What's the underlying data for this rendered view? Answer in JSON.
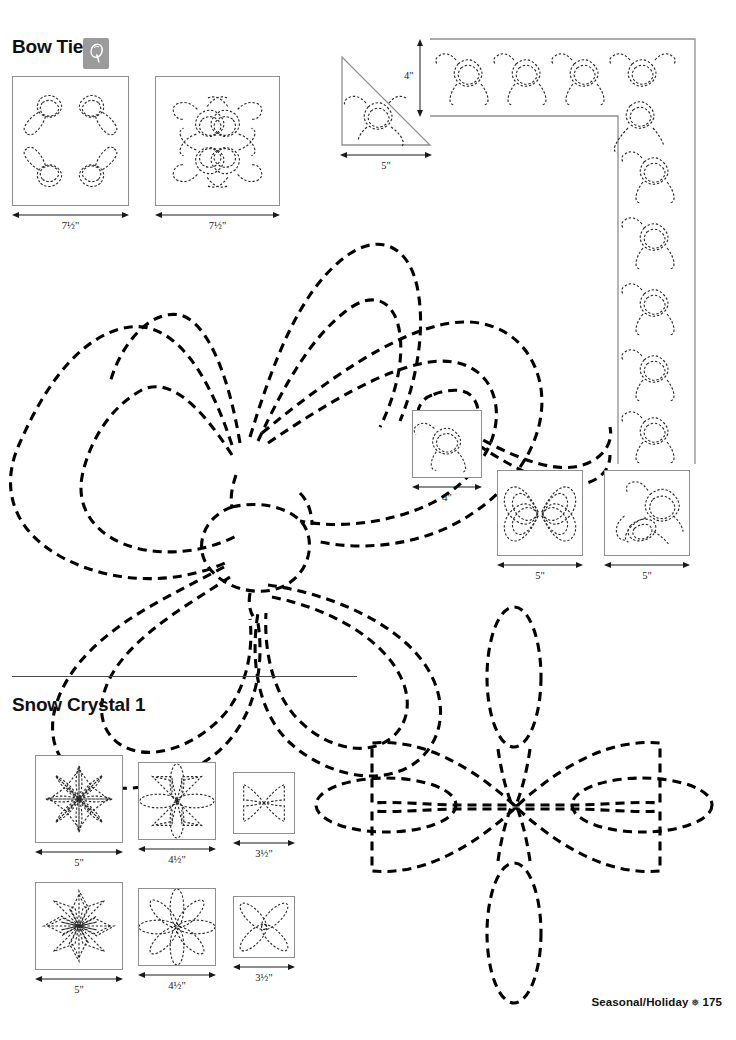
{
  "page": {
    "background": "#ffffff",
    "width": 736,
    "height": 1040
  },
  "sections": [
    {
      "id": "bow-tie",
      "title": "Bow Tie",
      "has_logo_badge": true,
      "logo_glyph": "Q"
    },
    {
      "id": "snow-crystal-1",
      "title": "Snow Crystal 1",
      "has_logo_badge": false,
      "logo_glyph": ""
    }
  ],
  "bow_tie": {
    "title": "Bow Tie",
    "badge_icon": "quilting-q-icon",
    "blocks": [
      {
        "name": "bow-wreath-square",
        "size_label": "7½\"",
        "shape": "square"
      },
      {
        "name": "bow-cluster-square",
        "size_label": "7½\"",
        "shape": "square"
      },
      {
        "name": "bow-triangle",
        "size_label": "5\"",
        "shape": "triangle"
      },
      {
        "name": "bow-border-corner",
        "size_label": "4\"",
        "shape": "border-corner",
        "orientation": "vertical-dimension"
      },
      {
        "name": "bow-single-square",
        "size_label": "4\"",
        "shape": "square"
      },
      {
        "name": "bow-rosette-square",
        "size_label": "5\"",
        "shape": "square"
      },
      {
        "name": "bow-single-tails-square",
        "size_label": "5\"",
        "shape": "square"
      }
    ],
    "main_motif": {
      "name": "large-bow-motif",
      "style": "heavy-dashed",
      "lobes": 4
    }
  },
  "snow_crystal": {
    "title": "Snow Crystal 1",
    "blocks": [
      {
        "name": "snow-8point-star-square",
        "size_label": "5\"",
        "row": 1,
        "column": 1
      },
      {
        "name": "snow-8petal-daisy-square",
        "size_label": "4½\"",
        "row": 1,
        "column": 2
      },
      {
        "name": "snow-4kite-square",
        "size_label": "3½\"",
        "row": 1,
        "column": 3
      },
      {
        "name": "snow-8point-star-alt-square",
        "size_label": "5\"",
        "row": 2,
        "column": 1
      },
      {
        "name": "snow-8petal-daisy-alt-square",
        "size_label": "4½\"",
        "row": 2,
        "column": 2
      },
      {
        "name": "snow-4petal-square",
        "size_label": "3½\"",
        "row": 2,
        "column": 3
      }
    ],
    "main_motif": {
      "name": "large-snow-crystal-motif",
      "style": "heavy-dashed",
      "petals": 4,
      "kites": 4
    }
  },
  "footer": {
    "category": "Seasonal/Holiday",
    "separator_glyph": "❅",
    "page_number": "175"
  },
  "colors": {
    "ink": "#000000",
    "frame": "#8f8f8f",
    "badge": "#9b9b9b",
    "divider": "#4a4a4a",
    "background": "#ffffff"
  }
}
